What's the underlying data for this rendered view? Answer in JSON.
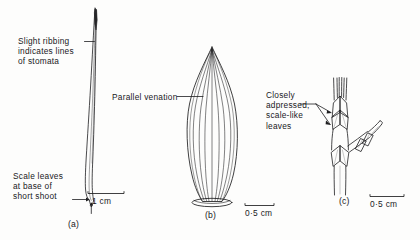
{
  "figure": {
    "background_color": "#fdfdfc",
    "ink_color": "#1a1a1a",
    "panels": [
      {
        "id": "a",
        "caption": "(a)",
        "subject": "long needle leaf of short shoot",
        "scale_bar": "1 cm",
        "labels": [
          "Slight ribbing",
          "indicates lines",
          "of stomata",
          "Scale leaves",
          "at base of",
          "short shoot"
        ]
      },
      {
        "id": "b",
        "caption": "(b)",
        "subject": "lanceolate leaf with parallel venation",
        "scale_bar": "0·5 cm",
        "labels": [
          "Parallel venation"
        ]
      },
      {
        "id": "c",
        "caption": "(c)",
        "subject": "shoot with scale-like leaves",
        "scale_bar": "0·5 cm",
        "labels": [
          "Closely",
          "adpressed,",
          "scale-like",
          "leaves"
        ]
      }
    ]
  },
  "annotations": {
    "ribbing": {
      "line1": "Slight ribbing",
      "line2": "indicates lines",
      "line3": "of stomata"
    },
    "scale_leaves": {
      "line1": "Scale leaves",
      "line2": "at base of",
      "line3": "short shoot"
    },
    "venation": {
      "line1": "Parallel venation"
    },
    "adpressed": {
      "line1": "Closely",
      "line2": "adpressed,",
      "line3": "scale-like",
      "line4": "leaves"
    }
  },
  "scale_bars": {
    "panel_a": "1 cm",
    "panel_b": "0·5 cm",
    "panel_c": "0·5 cm"
  },
  "captions": {
    "panel_a": "(a)",
    "panel_b": "(b)",
    "panel_c": "(c)"
  }
}
